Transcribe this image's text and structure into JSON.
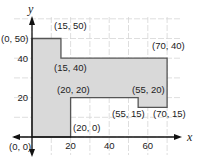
{
  "chart_data": {
    "type": "area",
    "title": "",
    "xlabel": "x",
    "ylabel": "y",
    "xlim": [
      0,
      75
    ],
    "ylim": [
      0,
      60
    ],
    "grid": true,
    "grid_step": 10,
    "x_ticks": [
      20,
      40,
      60
    ],
    "y_ticks": [
      20,
      40
    ],
    "polygon": [
      {
        "x": 0,
        "y": 0
      },
      {
        "x": 0,
        "y": 50
      },
      {
        "x": 15,
        "y": 50
      },
      {
        "x": 15,
        "y": 40
      },
      {
        "x": 70,
        "y": 40
      },
      {
        "x": 70,
        "y": 15
      },
      {
        "x": 55,
        "y": 15
      },
      {
        "x": 55,
        "y": 20
      },
      {
        "x": 20,
        "y": 20
      },
      {
        "x": 20,
        "y": 0
      }
    ],
    "point_labels": [
      {
        "text": "(0, 50)",
        "x": 0,
        "y": 50
      },
      {
        "text": "(15, 50)",
        "x": 15,
        "y": 50
      },
      {
        "text": "(15, 40)",
        "x": 15,
        "y": 40
      },
      {
        "text": "(70, 40)",
        "x": 70,
        "y": 40
      },
      {
        "text": "(20, 20)",
        "x": 20,
        "y": 20
      },
      {
        "text": "(55, 20)",
        "x": 55,
        "y": 20
      },
      {
        "text": "(55, 15)",
        "x": 55,
        "y": 15
      },
      {
        "text": "(70, 15)",
        "x": 70,
        "y": 15
      },
      {
        "text": "(20, 0)",
        "x": 20,
        "y": 0
      },
      {
        "text": "(0, 0)",
        "x": 0,
        "y": 0
      }
    ],
    "fill_color": "#d9d9d9",
    "stroke_color": "#555555"
  }
}
